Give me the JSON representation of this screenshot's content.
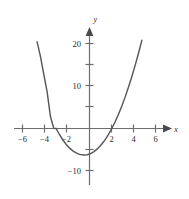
{
  "figure": {
    "name": "parabola-graph",
    "background_color": "#ffffff",
    "curve_color": "#58585a",
    "axis_color": "#6d6d70",
    "text_color": "#2b2b2b"
  },
  "axes": {
    "x_axis_label": "x",
    "y_axis_label": "y",
    "x_ticks_labeled": [
      "−6",
      "−4",
      "−2",
      "2",
      "4",
      "6"
    ],
    "y_ticks_labeled": [
      "20",
      "10",
      "−10"
    ]
  },
  "chart_data": {
    "type": "line",
    "title": "",
    "xlabel": "x",
    "ylabel": "y",
    "grid": false,
    "legend": null,
    "xlim": [
      -7.0,
      7.2
    ],
    "ylim": [
      -13.5,
      23.5
    ],
    "xticks": [
      -6,
      -4,
      -2,
      2,
      4,
      6
    ],
    "xticklabels": [
      "−6",
      "−4",
      "−2",
      "2",
      "4",
      "6"
    ],
    "yticks": [
      5,
      10,
      15,
      20,
      -10
    ],
    "yticklabels": [
      "",
      "10",
      "",
      "20",
      "−10"
    ],
    "minor_yticks": [
      5,
      15
    ],
    "series": [
      {
        "name": "y = x^2 + x - 6",
        "equation": "y = x^2 + x - 6",
        "roots": [
          -3,
          2
        ],
        "vertex": [
          -0.5,
          -6.25
        ],
        "y_intercept": -6,
        "x": [
          -4.7,
          -4.4,
          -4.1,
          -3.8,
          -3.5,
          -3.2,
          -3.0,
          -2.7,
          -2.4,
          -2.1,
          -1.8,
          -1.5,
          -1.2,
          -0.9,
          -0.5,
          -0.2,
          0.1,
          0.4,
          0.7,
          1.0,
          1.3,
          1.6,
          2.0,
          2.3,
          2.6,
          2.9,
          3.2,
          3.5,
          3.8,
          4.1,
          4.4,
          4.7
        ],
        "y": [
          20.4,
          16.96,
          12.71,
          8.64,
          2.75,
          0.04,
          0.0,
          -1.41,
          -2.64,
          -3.69,
          -4.56,
          -5.25,
          -5.76,
          -6.09,
          -6.25,
          -6.16,
          -5.89,
          -5.44,
          -4.81,
          -4.0,
          -3.01,
          -1.84,
          0.0,
          1.59,
          3.36,
          5.31,
          7.44,
          9.75,
          12.24,
          14.91,
          17.76,
          20.79
        ]
      }
    ]
  }
}
